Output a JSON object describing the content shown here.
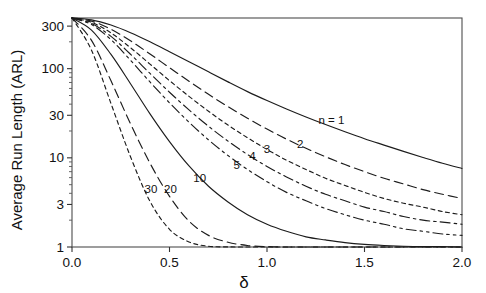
{
  "chart_data": {
    "type": "line",
    "title": "",
    "subtitle": "",
    "xlabel": "δ",
    "ylabel": "Average Run Length (ARL)",
    "xlim": [
      0.0,
      2.0
    ],
    "ylim": [
      1,
      370
    ],
    "yscale": "log",
    "xscale": "linear",
    "grid": false,
    "legend_position": "inline-curve-labels",
    "legend_title": "n",
    "xticks": [
      0.0,
      0.5,
      1.0,
      1.5,
      2.0
    ],
    "xtick_labels": [
      "0.0",
      "0.5",
      "1.0",
      "1.5",
      "2.0"
    ],
    "yticks": [
      1,
      3,
      10,
      30,
      100,
      300
    ],
    "ytick_labels": [
      "1",
      "3",
      "10",
      "30",
      "100",
      "300"
    ],
    "x": [
      0.0,
      0.1,
      0.2,
      0.3,
      0.4,
      0.5,
      0.6,
      0.7,
      0.8,
      0.9,
      1.0,
      1.1,
      1.2,
      1.3,
      1.4,
      1.5,
      1.6,
      1.7,
      1.8,
      1.9,
      2.0
    ],
    "series": [
      {
        "name": "n = 1",
        "label": "n = 1",
        "linestyle": "solid",
        "label_x": 1.33,
        "label_y": 24.0,
        "values": [
          370.4,
          352.9,
          308.4,
          253.1,
          200.1,
          155.2,
          119.7,
          92.1,
          71.1,
          55.3,
          43.9,
          35.3,
          28.7,
          23.6,
          19.6,
          16.4,
          13.9,
          11.8,
          10.1,
          8.7,
          7.6
        ]
      },
      {
        "name": "n = 2",
        "label": "2",
        "linestyle": "dashed-long",
        "label_x": 1.17,
        "label_y": 13.0,
        "values": [
          370.4,
          341.6,
          276.3,
          205.2,
          146.0,
          102.6,
          72.3,
          51.6,
          37.5,
          27.8,
          21.0,
          16.2,
          12.8,
          10.3,
          8.4,
          7.0,
          5.9,
          5.1,
          4.4,
          3.9,
          3.5
        ]
      },
      {
        "name": "n = 3",
        "label": "3",
        "linestyle": "dotted-fine",
        "label_x": 1.0,
        "label_y": 11.2,
        "values": [
          370.4,
          331.2,
          251.6,
          171.8,
          112.4,
          73.5,
          48.9,
          33.3,
          23.3,
          16.8,
          12.4,
          9.4,
          7.4,
          5.9,
          4.9,
          4.1,
          3.5,
          3.1,
          2.8,
          2.5,
          2.3
        ]
      },
      {
        "name": "n = 4",
        "label": "4",
        "linestyle": "dash-dot",
        "label_x": 0.925,
        "label_y": 9.4,
        "values": [
          370.4,
          321.4,
          230.2,
          145.2,
          88.4,
          54.4,
          34.5,
          22.6,
          15.4,
          10.9,
          8.0,
          6.1,
          4.8,
          3.9,
          3.3,
          2.8,
          2.5,
          2.2,
          2.0,
          1.9,
          1.8
        ]
      },
      {
        "name": "n = 5",
        "label": "5",
        "linestyle": "dash-dot-dot",
        "label_x": 0.845,
        "label_y": 7.5,
        "values": [
          370.4,
          312.1,
          211.4,
          124.3,
          70.9,
          41.4,
          25.1,
          15.9,
          10.6,
          7.4,
          5.4,
          4.1,
          3.3,
          2.7,
          2.3,
          2.0,
          1.8,
          1.6,
          1.5,
          1.4,
          1.35
        ]
      },
      {
        "name": "n = 10",
        "label": "10",
        "linestyle": "solid",
        "label_x": 0.655,
        "label_y": 5.3,
        "values": [
          370.4,
          271.0,
          144.4,
          67.8,
          31.1,
          15.2,
          8.1,
          4.8,
          3.2,
          2.3,
          1.8,
          1.5,
          1.3,
          1.2,
          1.12,
          1.07,
          1.04,
          1.02,
          1.01,
          1.01,
          1.0
        ]
      },
      {
        "name": "n = 20",
        "label": "20",
        "linestyle": "dashed-long",
        "label_x": 0.505,
        "label_y": 4.0,
        "values": [
          370.4,
          207.7,
          73.0,
          24.1,
          8.7,
          3.7,
          1.95,
          1.35,
          1.13,
          1.04,
          1.01,
          1.0,
          1.0,
          1.0,
          1.0,
          1.0,
          1.0,
          1.0,
          1.0,
          1.0,
          1.0
        ]
      },
      {
        "name": "n = 30",
        "label": "30",
        "linestyle": "dotted-fine",
        "label_x": 0.405,
        "label_y": 4.0,
        "values": [
          370.4,
          161.1,
          40.6,
          10.3,
          3.25,
          1.58,
          1.14,
          1.02,
          1.003,
          1.0,
          1.0,
          1.0,
          1.0,
          1.0,
          1.0,
          1.0,
          1.0,
          1.0,
          1.0,
          1.0,
          1.0
        ]
      }
    ],
    "annotations": [],
    "colors": {
      "curve": "#1c1c1c",
      "axis": "#4d4d4d",
      "text": "#111111",
      "background": "#ffffff"
    }
  }
}
